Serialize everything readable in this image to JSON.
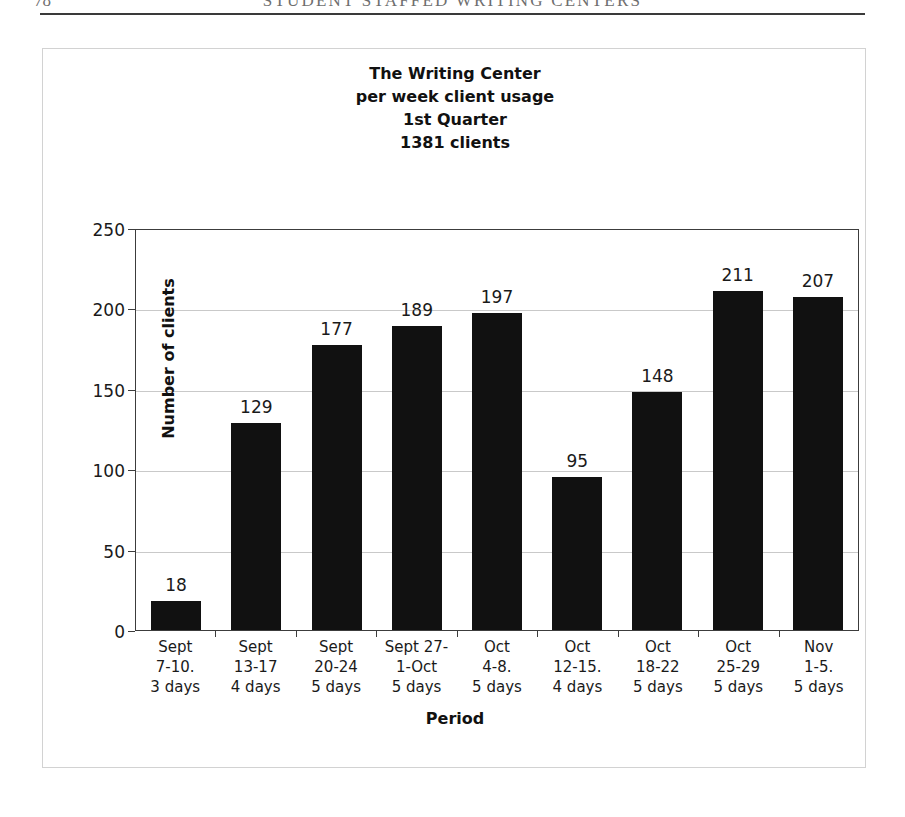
{
  "page_header": {
    "folio": "78",
    "running_head": "STUDENT STAFFED WRITING CENTERS"
  },
  "chart_data": {
    "type": "bar",
    "title_lines": [
      "The Writing Center",
      "per week client usage",
      "1st Quarter",
      "1381 clients"
    ],
    "xlabel": "Period",
    "ylabel": "Number of clients",
    "ylim": [
      0,
      250
    ],
    "ytick_labels": [
      "250",
      "200",
      "150",
      "100",
      "50",
      "0"
    ],
    "ytick_values": [
      250,
      200,
      150,
      100,
      50,
      0
    ],
    "grid": true,
    "legend": "none",
    "bar_color": "#111111",
    "plot_background": "#ffffff",
    "categories": [
      "Sept 7-10. 3 days",
      "Sept 13-17 4 days",
      "Sept 20-24 5 days",
      "Sept 27-1-Oct 5 days",
      "Oct 4-8. 5 days",
      "Oct 12-15. 4 days",
      "Oct 18-22 5 days",
      "Oct 25-29 5 days",
      "Nov 1-5. 5 days"
    ],
    "category_lines": [
      [
        "Sept",
        "7-10.",
        "3 days"
      ],
      [
        "Sept",
        "13-17",
        "4 days"
      ],
      [
        "Sept",
        "20-24",
        "5 days"
      ],
      [
        "Sept 27-",
        "1-Oct",
        "5 days"
      ],
      [
        "Oct",
        "4-8.",
        "5 days"
      ],
      [
        "Oct",
        "12-15.",
        "4 days"
      ],
      [
        "Oct",
        "18-22",
        "5 days"
      ],
      [
        "Oct",
        "25-29",
        "5 days"
      ],
      [
        "Nov",
        "1-5.",
        "5 days"
      ]
    ],
    "values": [
      18,
      129,
      177,
      189,
      197,
      95,
      148,
      211,
      207
    ],
    "value_labels": [
      "18",
      "129",
      "177",
      "189",
      "197",
      "95",
      "148",
      "211",
      "207"
    ],
    "total_clients": 1381
  }
}
